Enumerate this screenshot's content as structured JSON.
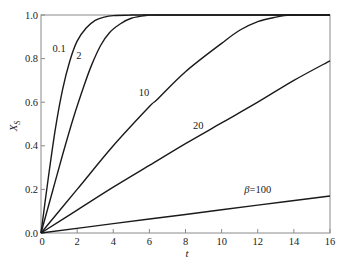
{
  "chart_data": {
    "type": "line",
    "title": "",
    "xlabel": "t",
    "ylabel": "X_S",
    "ylabel_main": "X",
    "ylabel_sub": "S",
    "xlim": [
      0,
      16
    ],
    "ylim": [
      0.0,
      1.0
    ],
    "xticks": [
      0,
      2,
      4,
      6,
      8,
      10,
      12,
      14,
      16
    ],
    "yticks": [
      0.0,
      0.2,
      0.4,
      0.6,
      0.8,
      1.0
    ],
    "xtick_labels": [
      "0",
      "2",
      "4",
      "6",
      "8",
      "10",
      "12",
      "14",
      "16"
    ],
    "ytick_labels": [
      "0.0",
      "0.2",
      "0.4",
      "0.6",
      "0.8",
      "1.0"
    ],
    "grid": false,
    "legend": "inline curve labels",
    "series": [
      {
        "name": "β=0.1",
        "label": "0.1",
        "x": [
          0,
          0.4,
          0.8,
          1.2,
          1.6,
          2.0,
          2.5,
          3.0,
          3.5,
          4.0,
          5.0,
          6.0,
          16
        ],
        "y": [
          0,
          0.25,
          0.48,
          0.66,
          0.79,
          0.88,
          0.94,
          0.975,
          0.99,
          0.997,
          1.0,
          1.0,
          1.0
        ]
      },
      {
        "name": "β=2",
        "label": "2",
        "x": [
          0,
          0.6,
          1.2,
          1.8,
          2.4,
          2.8,
          3.3,
          3.8,
          4.4,
          5.0,
          5.8,
          6.6,
          16
        ],
        "y": [
          0,
          0.18,
          0.36,
          0.53,
          0.68,
          0.77,
          0.86,
          0.92,
          0.96,
          0.985,
          0.997,
          1.0,
          1.0
        ]
      },
      {
        "name": "β=10",
        "label": "10",
        "x": [
          0,
          2,
          4,
          6,
          6.4,
          8,
          10,
          11,
          12,
          13,
          13.8,
          16
        ],
        "y": [
          0,
          0.2,
          0.4,
          0.58,
          0.61,
          0.74,
          0.87,
          0.93,
          0.97,
          0.99,
          1.0,
          1.0
        ]
      },
      {
        "name": "β=20",
        "label": "20",
        "x": [
          0,
          2,
          4,
          6,
          8,
          10,
          12,
          14,
          16
        ],
        "y": [
          0,
          0.105,
          0.21,
          0.31,
          0.41,
          0.505,
          0.6,
          0.7,
          0.79
        ]
      },
      {
        "name": "β=100",
        "label": "β=100",
        "x": [
          0,
          4,
          8,
          12,
          16
        ],
        "y": [
          0,
          0.043,
          0.085,
          0.128,
          0.17
        ]
      }
    ],
    "annotations": [
      {
        "text": "0.1",
        "x": 1.0,
        "y": 0.83
      },
      {
        "text": "2",
        "x": 2.1,
        "y": 0.8
      },
      {
        "text": "10",
        "x": 5.7,
        "y": 0.63
      },
      {
        "text": "20",
        "x": 8.7,
        "y": 0.475
      },
      {
        "text": "β=100",
        "x": 12.0,
        "y": 0.185
      }
    ]
  }
}
